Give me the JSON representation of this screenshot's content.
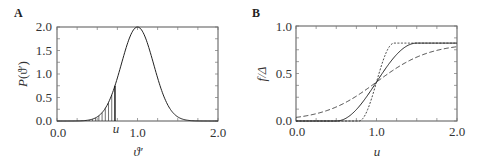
{
  "chart_data": [
    {
      "panel": "A",
      "type": "line",
      "title": "",
      "xlabel": "ϑ′",
      "ylabel": "P(ϑ′)",
      "xlim": [
        0.0,
        2.0
      ],
      "ylim": [
        0.0,
        2.0
      ],
      "xticks": [
        "0.0",
        "1.0",
        "2.0"
      ],
      "yticks": [
        "0.0",
        "0.5",
        "1.0",
        "1.5",
        "2.0"
      ],
      "grid": false,
      "annotations": [
        {
          "text": "u",
          "x": 0.72,
          "note": "shaded area under curve from 0 to u"
        }
      ],
      "series": [
        {
          "name": "Gaussian density",
          "style": "solid",
          "mean": 1.0,
          "sigma": 0.2,
          "peak": 2.0,
          "x": [
            0.0,
            0.4,
            0.5,
            0.6,
            0.7,
            0.72,
            0.8,
            0.9,
            1.0,
            1.1,
            1.2,
            1.3,
            1.4,
            1.5,
            1.6,
            2.0
          ],
          "y": [
            0.0,
            0.02,
            0.09,
            0.27,
            0.65,
            0.75,
            1.21,
            1.76,
            2.0,
            1.76,
            1.21,
            0.65,
            0.27,
            0.09,
            0.02,
            0.0
          ]
        }
      ],
      "shaded_region": {
        "from": 0.0,
        "to": 0.72
      }
    },
    {
      "panel": "B",
      "type": "line",
      "title": "",
      "xlabel": "u",
      "ylabel": "f/Δ",
      "xlim": [
        0.0,
        2.0
      ],
      "ylim": [
        0.0,
        1.0
      ],
      "xticks": [
        "0.0",
        "1.0",
        "2.0"
      ],
      "yticks": [
        "0.0",
        "0.5",
        "1.0"
      ],
      "grid": false,
      "series": [
        {
          "name": "short-dashed (narrow)",
          "style": "dotted",
          "x": [
            0.0,
            0.7,
            0.8,
            0.9,
            1.0,
            1.1,
            1.2,
            1.3,
            2.0
          ],
          "y": [
            0.0,
            0.0,
            0.02,
            0.16,
            0.42,
            0.68,
            0.8,
            0.82,
            0.82
          ]
        },
        {
          "name": "solid (medium)",
          "style": "solid",
          "x": [
            0.0,
            0.5,
            0.6,
            0.7,
            0.8,
            0.9,
            1.0,
            1.1,
            1.2,
            1.3,
            1.4,
            1.5,
            2.0
          ],
          "y": [
            0.0,
            0.0,
            0.02,
            0.06,
            0.15,
            0.27,
            0.42,
            0.57,
            0.69,
            0.77,
            0.81,
            0.82,
            0.82
          ]
        },
        {
          "name": "long-dashed (wide)",
          "style": "dashed",
          "x": [
            0.0,
            0.2,
            0.4,
            0.6,
            0.8,
            1.0,
            1.2,
            1.4,
            1.6,
            1.8,
            2.0
          ],
          "y": [
            0.02,
            0.06,
            0.12,
            0.2,
            0.3,
            0.42,
            0.54,
            0.65,
            0.73,
            0.78,
            0.8
          ]
        }
      ]
    }
  ],
  "labels": {
    "panelA": "A",
    "panelB": "B",
    "A_ylabel_P": "P",
    "A_ylabel_arg": "(ϑ′)",
    "A_xlabel": "ϑ′",
    "A_u": "u",
    "B_ylabel": "f/Δ",
    "B_xlabel": "u",
    "A_xt0": "0.0",
    "A_xt1": "1.0",
    "A_xt2": "2.0",
    "A_yt0": "0.0",
    "A_yt1": "0.5",
    "A_yt2": "1.0",
    "A_yt3": "1.5",
    "A_yt4": "2.0",
    "B_xt0": "0.0",
    "B_xt1": "1.0",
    "B_xt2": "2.0",
    "B_yt0": "0.0",
    "B_yt1": "0.5",
    "B_yt2": "1.0"
  }
}
